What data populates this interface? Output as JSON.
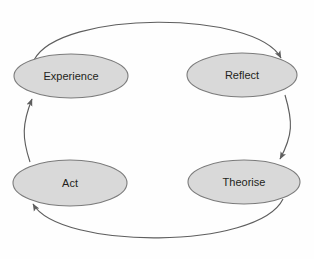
{
  "diagram": {
    "type": "cyclical-process",
    "direction": "clockwise",
    "background_color": "#fefefe",
    "node_fill_color": "#d9d9d9",
    "node_stroke_color": "#7b7b7b",
    "label_color": "#231f20",
    "arrow_color": "#5e5e5e",
    "nodes": [
      {
        "id": "experience",
        "label": "Experience",
        "cx": 71,
        "cy": 76,
        "rx": 57,
        "ry": 22
      },
      {
        "id": "reflect",
        "label": "Reflect",
        "cx": 242,
        "cy": 75,
        "rx": 55,
        "ry": 22
      },
      {
        "id": "theorise",
        "label": "Theorise",
        "cx": 244,
        "cy": 182,
        "rx": 56,
        "ry": 22
      },
      {
        "id": "act",
        "label": "Act",
        "cx": 70,
        "cy": 183,
        "rx": 57,
        "ry": 23
      }
    ],
    "edges": [
      {
        "id": "experience-to-reflect",
        "from": "Experience",
        "to": "Reflect",
        "shape": "arc-top",
        "arrowhead": "end"
      },
      {
        "id": "reflect-to-theorise",
        "from": "Reflect",
        "to": "Theorise",
        "shape": "line-right",
        "arrowhead": "end"
      },
      {
        "id": "theorise-to-act",
        "from": "Theorise",
        "to": "Act",
        "shape": "arc-bottom",
        "arrowhead": "end"
      },
      {
        "id": "act-to-experience",
        "from": "Act",
        "to": "Experience",
        "shape": "line-left",
        "arrowhead": "end"
      }
    ]
  }
}
